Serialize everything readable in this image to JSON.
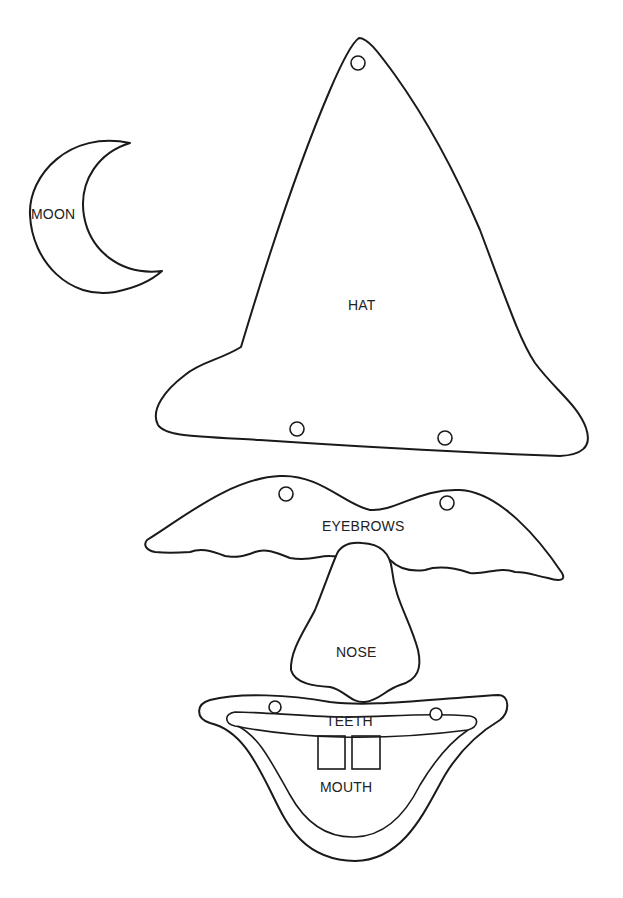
{
  "pieces": {
    "moon": {
      "label": "MOON"
    },
    "hat": {
      "label": "HAT",
      "holes": 3
    },
    "eyebrows": {
      "label": "EYEBROWS",
      "holes": 2
    },
    "nose": {
      "label": "NOSE"
    },
    "teeth": {
      "label": "TEETH",
      "holes": 2
    },
    "mouth": {
      "label": "MOUTH"
    }
  },
  "colors": {
    "line": "#1a1a1a",
    "background": "#ffffff"
  }
}
